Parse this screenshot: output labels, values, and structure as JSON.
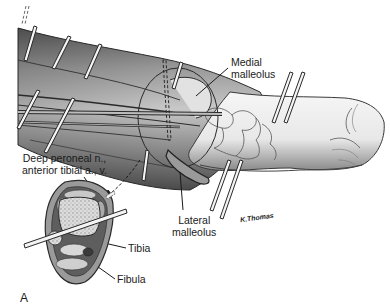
{
  "figure": {
    "panel_letter": "A",
    "artist_signature": "K.Thomas",
    "labels": {
      "medial_malleolus": [
        "Medial",
        "malleolus"
      ],
      "deep_peroneal": [
        "Deep peroneal n.,",
        "anterior tibial a., v."
      ],
      "lateral_malleolus": [
        "Lateral",
        "malleolus"
      ],
      "tibia": "Tibia",
      "fibula": "Fibula"
    },
    "colors": {
      "skin_dark": "#6e6e6e",
      "skin_mid": "#a8a8a8",
      "skin_light": "#e6e6e6",
      "bone": "#d9d9d9",
      "outline": "#2a2a2a",
      "pin_fill": "#f4f4f4"
    }
  }
}
